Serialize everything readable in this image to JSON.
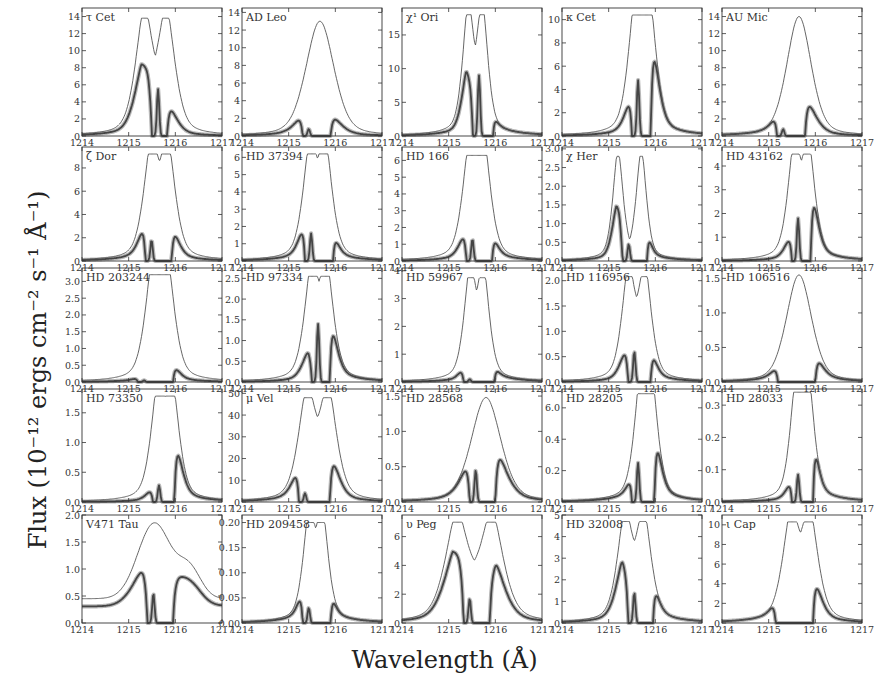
{
  "figure": {
    "xlabel": "Wavelength (Å)",
    "ylabel": "Flux (10⁻¹² ergs cm⁻² s⁻¹ Å⁻¹)",
    "colors": {
      "intrinsic": "#555555",
      "observed": "#444444",
      "data_band": "#9a9a9a",
      "axes": "#333333"
    }
  },
  "chart_data": {
    "type": "line",
    "layout": {
      "rows": 5,
      "cols": 5,
      "grid": false
    },
    "xlabel": "Wavelength (Å)",
    "ylabel": "Flux (10^-12 ergs cm^-2 s^-1 Å^-1)",
    "xlim": [
      1214,
      1217
    ],
    "xticks": [
      "1214",
      "1215",
      "1216",
      "1217"
    ],
    "series_legend": [
      "intrinsic reconstructed Lyα profile (thin line)",
      "observed / attenuated profile (thick line with data band)"
    ],
    "panels": [
      {
        "name": "τ Cet",
        "ylim": [
          0,
          15
        ],
        "yticks": [
          "0",
          "2",
          "4",
          "6",
          "8",
          "10",
          "12",
          "14"
        ],
        "shape": "double",
        "intrinsic_peak": 13.8,
        "peak_sep": 0.47,
        "center": 1215.57,
        "dip": 0.72,
        "width": 0.34,
        "obs_blue": 8.5,
        "obs_red": 3.1,
        "abs_lo": 1215.5,
        "abs_hi": 1215.82,
        "d_blue": 5.5
      },
      {
        "name": "AD Leo",
        "ylim": [
          0,
          14.5
        ],
        "yticks": [
          "0",
          "2",
          "4",
          "6",
          "8",
          "10",
          "12",
          "14"
        ],
        "shape": "single",
        "intrinsic_peak": 13.0,
        "center": 1215.67,
        "width": 0.4,
        "obs_blue": 2.0,
        "obs_red": 2.0,
        "abs_lo": 1215.3,
        "abs_hi": 1215.9,
        "d_blue": 0.8
      },
      {
        "name": "χ¹ Ori",
        "ylim": [
          0,
          19
        ],
        "yticks": [
          "0",
          "5",
          "10",
          "15"
        ],
        "shape": "double",
        "intrinsic_peak": 18.0,
        "peak_sep": 0.3,
        "center": 1215.57,
        "dip": 0.83,
        "width": 0.22,
        "obs_blue": 10.2,
        "obs_red": 2.2,
        "abs_lo": 1215.52,
        "abs_hi": 1215.95,
        "d_blue": 9.0
      },
      {
        "name": "κ Cet",
        "ylim": [
          0,
          11
        ],
        "yticks": [
          "0",
          "2",
          "4",
          "6",
          "8",
          "10"
        ],
        "shape": "double",
        "intrinsic_peak": 10.4,
        "peak_sep": 0.3,
        "center": 1215.72,
        "dip": 0.94,
        "width": 0.28,
        "obs_blue": 2.8,
        "obs_red": 6.5,
        "abs_lo": 1215.5,
        "abs_hi": 1215.9,
        "d_blue": 4.8
      },
      {
        "name": "AU Mic",
        "ylim": [
          0,
          15
        ],
        "yticks": [
          "0",
          "2",
          "4",
          "6",
          "8",
          "10",
          "12",
          "14"
        ],
        "shape": "single",
        "intrinsic_peak": 14.0,
        "center": 1215.65,
        "width": 0.35,
        "obs_blue": 1.9,
        "obs_red": 3.7,
        "abs_lo": 1215.18,
        "abs_hi": 1215.78,
        "d_blue": 0.8
      },
      {
        "name": "ζ Dor",
        "ylim": [
          0,
          9.8
        ],
        "yticks": [
          "0",
          "2",
          "4",
          "6",
          "8"
        ],
        "shape": "double",
        "intrinsic_peak": 9.2,
        "peak_sep": 0.35,
        "center": 1215.66,
        "dip": 0.94,
        "width": 0.3,
        "obs_blue": 2.6,
        "obs_red": 2.1,
        "abs_lo": 1215.36,
        "abs_hi": 1215.92,
        "d_blue": 1.8
      },
      {
        "name": "HD 37394",
        "ylim": [
          0,
          6.6
        ],
        "yticks": [
          "0",
          "1",
          "2",
          "3",
          "4",
          "5",
          "6"
        ],
        "shape": "double",
        "intrinsic_peak": 6.2,
        "peak_sep": 0.32,
        "center": 1215.62,
        "dip": 0.95,
        "width": 0.28,
        "obs_blue": 1.7,
        "obs_red": 1.0,
        "abs_lo": 1215.35,
        "abs_hi": 1215.95,
        "d_blue": 1.6
      },
      {
        "name": "HD 166",
        "ylim": [
          0,
          6.8
        ],
        "yticks": [
          "0",
          "1",
          "2",
          "3",
          "4",
          "5",
          "6"
        ],
        "shape": "double",
        "intrinsic_peak": 6.3,
        "peak_sep": 0.3,
        "center": 1215.6,
        "dip": 0.95,
        "width": 0.28,
        "obs_blue": 1.45,
        "obs_red": 1.0,
        "abs_lo": 1215.38,
        "abs_hi": 1215.93,
        "d_blue": 1.3
      },
      {
        "name": "χ Her",
        "ylim": [
          0,
          3.05
        ],
        "yticks": [
          "0.0",
          "0.5",
          "1.0",
          "1.5",
          "2.0",
          "2.5",
          "3.0"
        ],
        "shape": "double",
        "intrinsic_peak": 2.8,
        "peak_sep": 0.5,
        "center": 1215.45,
        "dip": 0.38,
        "width": 0.2,
        "obs_blue": 1.6,
        "obs_red": 0.4,
        "abs_lo": 1215.3,
        "abs_hi": 1215.82,
        "d_blue": 0.45
      },
      {
        "name": "HD 43162",
        "ylim": [
          0,
          4.8
        ],
        "yticks": [
          "0",
          "1",
          "2",
          "3",
          "4"
        ],
        "shape": "double",
        "intrinsic_peak": 4.5,
        "peak_sep": 0.3,
        "center": 1215.7,
        "dip": 0.93,
        "width": 0.26,
        "obs_blue": 0.9,
        "obs_red": 2.2,
        "abs_lo": 1215.5,
        "abs_hi": 1215.9,
        "d_blue": 1.8
      },
      {
        "name": "HD 203244",
        "ylim": [
          0,
          3.4
        ],
        "yticks": [
          "0.0",
          "0.5",
          "1.0",
          "1.5",
          "2.0",
          "2.5",
          "3.0"
        ],
        "shape": "double",
        "intrinsic_peak": 3.2,
        "peak_sep": 0.3,
        "center": 1215.67,
        "dip": 0.94,
        "width": 0.3,
        "obs_blue": 0.1,
        "obs_red": 0.35,
        "abs_lo": 1215.2,
        "abs_hi": 1215.95,
        "d_blue": 0.05
      },
      {
        "name": "HD 97334",
        "ylim": [
          0,
          2.75
        ],
        "yticks": [
          "0.0",
          "0.5",
          "1.0",
          "1.5",
          "2.0",
          "2.5"
        ],
        "shape": "double",
        "intrinsic_peak": 2.55,
        "peak_sep": 0.32,
        "center": 1215.65,
        "dip": 0.95,
        "width": 0.28,
        "obs_blue": 0.8,
        "obs_red": 1.1,
        "abs_lo": 1215.5,
        "abs_hi": 1215.88,
        "d_blue": 1.4
      },
      {
        "name": "HD 59967",
        "ylim": [
          0,
          4.1
        ],
        "yticks": [
          "0",
          "1",
          "2",
          "3",
          "4"
        ],
        "shape": "double",
        "intrinsic_peak": 3.75,
        "peak_sep": 0.28,
        "center": 1215.6,
        "dip": 0.83,
        "width": 0.24,
        "obs_blue": 0.35,
        "obs_red": 0.35,
        "abs_lo": 1215.32,
        "abs_hi": 1215.98,
        "d_blue": 0.1
      },
      {
        "name": "HD 116956",
        "ylim": [
          0,
          2.25
        ],
        "yticks": [
          "0.0",
          "0.5",
          "1.0",
          "1.5",
          "2.0"
        ],
        "shape": "double",
        "intrinsic_peak": 2.08,
        "peak_sep": 0.35,
        "center": 1215.6,
        "dip": 0.94,
        "width": 0.26,
        "obs_blue": 0.6,
        "obs_red": 0.4,
        "abs_lo": 1215.42,
        "abs_hi": 1215.9,
        "d_blue": 0.6
      },
      {
        "name": "HD 106516",
        "ylim": [
          0,
          1.65
        ],
        "yticks": [
          "0.0",
          "0.5",
          "1.0",
          "1.5"
        ],
        "shape": "single",
        "intrinsic_peak": 1.55,
        "center": 1215.65,
        "width": 0.36,
        "obs_blue": 0.18,
        "obs_red": 0.28,
        "abs_lo": 1215.2,
        "abs_hi": 1216.0,
        "d_blue": 0.0
      },
      {
        "name": "HD 73350",
        "ylim": [
          0,
          1.9
        ],
        "yticks": [
          "0.0",
          "0.5",
          "1.0",
          "1.5"
        ],
        "shape": "double",
        "intrinsic_peak": 1.78,
        "peak_sep": 0.3,
        "center": 1215.78,
        "dip": 0.93,
        "width": 0.28,
        "obs_blue": 0.18,
        "obs_red": 0.78,
        "abs_lo": 1215.52,
        "abs_hi": 1215.98,
        "d_blue": 0.28
      },
      {
        "name": "μ Vel",
        "ylim": [
          0,
          52
        ],
        "yticks": [
          "0",
          "10",
          "20",
          "30",
          "40",
          "50"
        ],
        "shape": "double",
        "intrinsic_peak": 48.0,
        "peak_sep": 0.45,
        "center": 1215.62,
        "dip": 0.93,
        "width": 0.34,
        "obs_blue": 12.5,
        "obs_red": 17.5,
        "abs_lo": 1215.22,
        "abs_hi": 1215.88,
        "d_blue": 4.0
      },
      {
        "name": "HD 28568",
        "ylim": [
          0,
          1.6
        ],
        "yticks": [
          "0.0",
          "0.5",
          "1.0",
          "1.5"
        ],
        "shape": "single",
        "intrinsic_peak": 1.48,
        "center": 1215.8,
        "width": 0.42,
        "obs_blue": 0.5,
        "obs_red": 0.65,
        "abs_lo": 1215.45,
        "abs_hi": 1216.0,
        "d_blue": 0.45
      },
      {
        "name": "HD 28205",
        "ylim": [
          0,
          0.72
        ],
        "yticks": [
          "0.0",
          "0.2",
          "0.4",
          "6.0"
        ],
        "shape": "double",
        "intrinsic_peak": 0.69,
        "peak_sep": 0.22,
        "center": 1215.8,
        "dip": 0.96,
        "width": 0.26,
        "obs_blue": 0.12,
        "obs_red": 0.3,
        "abs_lo": 1215.5,
        "abs_hi": 1215.98,
        "d_blue": 0.25
      },
      {
        "name": "HD 28033",
        "ylim": [
          0,
          0.35
        ],
        "yticks": [
          "0.0",
          "0.1",
          "0.2",
          "0.3"
        ],
        "shape": "double",
        "intrinsic_peak": 0.34,
        "peak_sep": 0.26,
        "center": 1215.72,
        "dip": 0.94,
        "width": 0.24,
        "obs_blue": 0.05,
        "obs_red": 0.13,
        "abs_lo": 1215.5,
        "abs_hi": 1215.95,
        "d_blue": 0.085
      },
      {
        "name": "V471 Tau",
        "ylim": [
          0,
          2.0
        ],
        "yticks": [
          "0.0",
          "0.5",
          "1.0",
          "1.5",
          "2.0"
        ],
        "shape": "broad",
        "intrinsic_peak": 1.85,
        "center": 1215.55,
        "width": 0.35,
        "base": 0.45,
        "red_bump": 1.05,
        "obs_blue": 1.05,
        "obs_red": 0.9,
        "abs_lo": 1215.4,
        "abs_hi": 1215.95,
        "d_blue": 0.55
      },
      {
        "name": "HD 209458",
        "ylim": [
          0,
          0.215
        ],
        "yticks": [
          "0.00",
          "0.05",
          "0.10",
          "0.15",
          "0.20"
        ],
        "shape": "double",
        "intrinsic_peak": 0.2,
        "peak_sep": 0.28,
        "center": 1215.58,
        "dip": 0.96,
        "width": 0.24,
        "obs_blue": 0.045,
        "obs_red": 0.035,
        "abs_lo": 1215.3,
        "abs_hi": 1215.9,
        "d_blue": 0.03
      },
      {
        "name": "υ Peg",
        "ylim": [
          0,
          7.5
        ],
        "yticks": [
          "0",
          "2",
          "4",
          "6"
        ],
        "shape": "broaddouble",
        "intrinsic_peak": 7.0,
        "peak_sep": 0.75,
        "center": 1215.55,
        "dip": 0.87,
        "width": 0.45,
        "obs_blue": 5.0,
        "obs_red": 4.3,
        "abs_lo": 1215.32,
        "abs_hi": 1215.88,
        "d_blue": 1.7
      },
      {
        "name": "HD 32008",
        "ylim": [
          0,
          5.0
        ],
        "yticks": [
          "0",
          "1",
          "2",
          "3",
          "4",
          "5"
        ],
        "shape": "double",
        "intrinsic_peak": 4.7,
        "peak_sep": 0.4,
        "center": 1215.55,
        "dip": 0.93,
        "width": 0.3,
        "obs_blue": 3.05,
        "obs_red": 2.8,
        "abs_lo": 1215.42,
        "abs_hi": 1215.95,
        "d_blue": 1.4
      },
      {
        "name": "ι Cap",
        "ylim": [
          0,
          11
        ],
        "yticks": [
          "0",
          "2",
          "4",
          "6",
          "8",
          "10"
        ],
        "shape": "double",
        "intrinsic_peak": 10.3,
        "peak_sep": 0.4,
        "center": 1215.68,
        "dip": 0.93,
        "width": 0.33,
        "obs_blue": 1.9,
        "obs_red": 3.6,
        "abs_lo": 1215.15,
        "abs_hi": 1215.95,
        "d_blue": 0.0
      }
    ]
  }
}
